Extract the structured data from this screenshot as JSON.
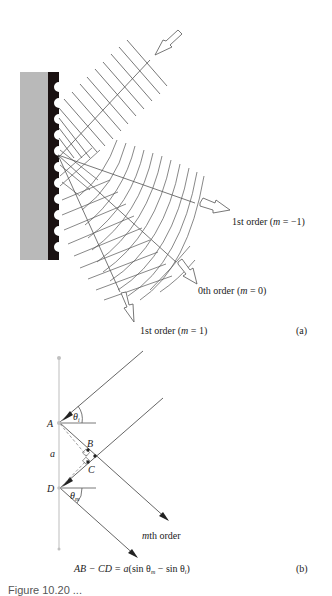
{
  "figure_a": {
    "panel_label": "(a)",
    "orders": [
      {
        "label": "1st order (",
        "m_symbol": "m",
        "eq": " = −1)",
        "full": "1st order (m = −1)"
      },
      {
        "label": "0th order (",
        "m_symbol": "m",
        "eq": " = 0)",
        "full": "0th order (m = 0)"
      },
      {
        "label": "1st order (",
        "m_symbol": "m",
        "eq": " = 1)",
        "full": "1st order (m = 1)"
      }
    ],
    "colors": {
      "substrate": "#b9b9b9",
      "grating": "#1a1111",
      "lines": "#555555"
    }
  },
  "figure_b": {
    "panel_label": "(b)",
    "points": {
      "A": "A",
      "B": "B",
      "C": "C",
      "D": "D"
    },
    "spacing_label": "a",
    "theta_i": "θ",
    "theta_i_sub": "i",
    "theta_m": "θ",
    "theta_m_sub": "m",
    "order_label_prefix": "m",
    "order_label_suffix": "th order",
    "equation": "AB − CD = a(sin θm − sin θi)",
    "equation_parts": {
      "lhs": "AB − CD = ",
      "a": "a",
      "mid": "(sin θ",
      "sub_m": "m",
      "minus": " − sin θ",
      "sub_i": "i",
      "close": ")"
    }
  },
  "caption": {
    "text": "Figure 10.20 ..."
  }
}
